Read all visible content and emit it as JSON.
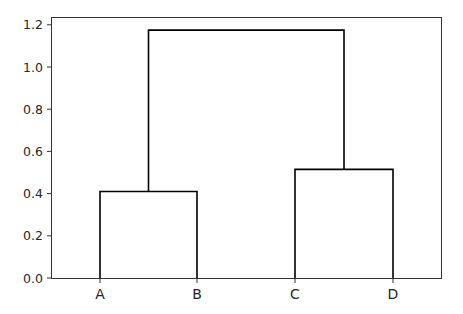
{
  "chart_data": {
    "type": "dendrogram",
    "title": "",
    "xlabel": "",
    "ylabel": "",
    "leaves": [
      "A",
      "B",
      "C",
      "D"
    ],
    "merges": [
      {
        "left": "A",
        "right": "B",
        "height": 0.41
      },
      {
        "left": "C",
        "right": "D",
        "height": 0.515
      },
      {
        "left": "A-B",
        "right": "C-D",
        "height": 1.175
      }
    ],
    "ylim": [
      0.0,
      1.23
    ],
    "yticks": [
      "0.0",
      "0.2",
      "0.4",
      "0.6",
      "0.8",
      "1.0",
      "1.2"
    ],
    "grid": false,
    "line_color": "#000000"
  }
}
